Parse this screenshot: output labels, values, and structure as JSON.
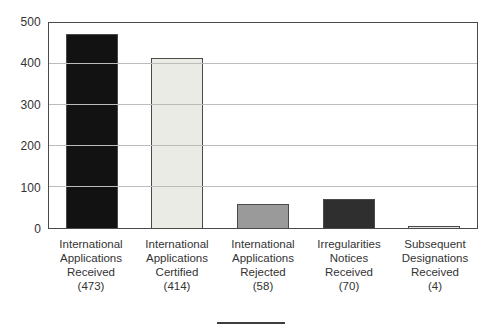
{
  "chart_data": {
    "type": "bar",
    "title": "",
    "xlabel": "",
    "ylabel": "",
    "categories": [
      "International Applications Received",
      "International Applications Certified",
      "International Applications Rejected",
      "Irregularities Notices Received",
      "Subsequent Designations Received"
    ],
    "values": [
      473,
      414,
      58,
      70,
      4
    ],
    "x_label_lines": [
      [
        "International",
        "Applications",
        "Received",
        "(473)"
      ],
      [
        "International",
        "Applications",
        "Certified",
        "(414)"
      ],
      [
        "International",
        "Applications",
        "Rejected",
        "(58)"
      ],
      [
        "Irregularities",
        "Notices",
        "Received",
        "(70)"
      ],
      [
        "Subsequent",
        "Designations",
        "Received",
        "(4)"
      ]
    ],
    "ylim": [
      0,
      500
    ],
    "yticks": [
      0,
      100,
      200,
      300,
      400,
      500
    ],
    "grid": "horizontal",
    "legend": "none",
    "bar_colors": [
      "#121212",
      "#ebebe6",
      "#9a9a9a",
      "#2f2f2f",
      "#e4e4e0"
    ],
    "bar_border_color": "#4a4a4a",
    "axis_border_color": "#4a4a4a",
    "gridline_color": "#bcbcbc",
    "label_color": "#333333",
    "background_color": "#ffffff"
  },
  "footer": {
    "divider_color": "#3d3d3d"
  }
}
